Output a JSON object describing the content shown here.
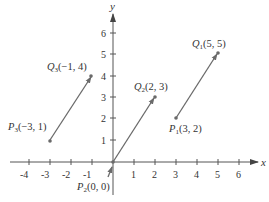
{
  "axes": {
    "x_label": "x",
    "y_label": "y",
    "x_ticks": [
      "-4",
      "-3",
      "-2",
      "-1",
      "1",
      "2",
      "3",
      "4",
      "5",
      "6"
    ],
    "y_ticks": [
      "1",
      "2",
      "3",
      "4",
      "5",
      "6"
    ]
  },
  "vectors": [
    {
      "id": "v1",
      "tail_label_main": "P",
      "tail_sub": "1",
      "tail_coords": "(3, 2)",
      "head_label_main": "Q",
      "head_sub": "1",
      "head_coords": "(5, 5)",
      "tail": [
        3,
        2
      ],
      "head": [
        5,
        5
      ]
    },
    {
      "id": "v2",
      "tail_label_main": "P",
      "tail_sub": "2",
      "tail_coords": "(0, 0)",
      "head_label_main": "Q",
      "head_sub": "2",
      "head_coords": "(2, 3)",
      "tail": [
        0,
        0
      ],
      "head": [
        2,
        3
      ]
    },
    {
      "id": "v3",
      "tail_label_main": "P",
      "tail_sub": "3",
      "tail_coords": "(−3, 1)",
      "head_label_main": "Q",
      "head_sub": "3",
      "head_coords": "(−1, 4)",
      "tail": [
        -3,
        1
      ],
      "head": [
        -1,
        4
      ]
    }
  ],
  "colors": {
    "axis": "#555555",
    "vector": "#6a6a6a",
    "text": "#333333"
  }
}
